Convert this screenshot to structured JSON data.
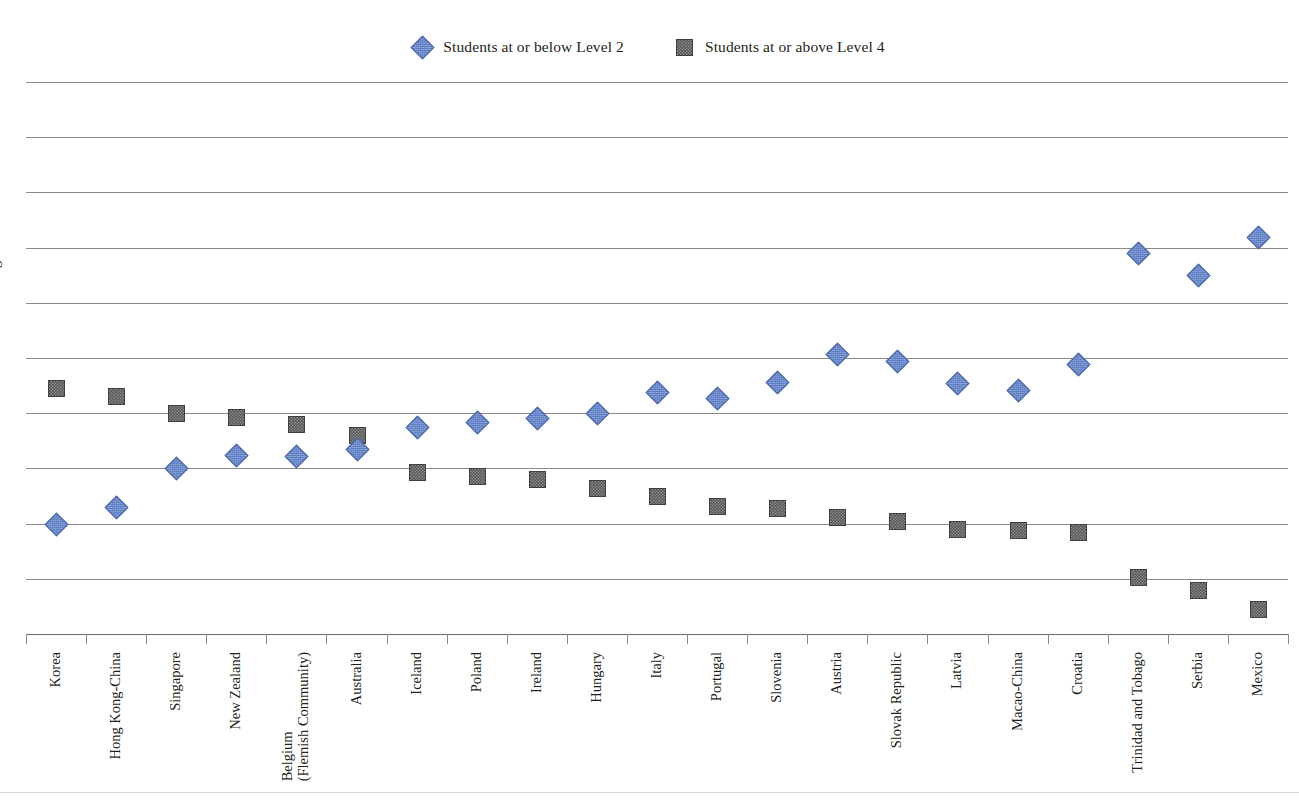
{
  "legend": {
    "items": [
      {
        "label": "Students at or below Level 2",
        "marker": "diamond-marker-icon",
        "color": "#5b7cc4"
      },
      {
        "label": "Students at or above Level 4",
        "marker": "square-marker-icon",
        "color": "#595959"
      }
    ]
  },
  "axes": {
    "ylabel": "Percentage of students",
    "yticks": [
      "0",
      "10",
      "20",
      "30",
      "40",
      "50",
      "60",
      "70",
      "80",
      "90",
      "100"
    ]
  },
  "chart_data": {
    "type": "scatter",
    "title": "",
    "xlabel": "",
    "ylabel": "Percentage of students",
    "ylim": [
      0,
      100
    ],
    "grid": true,
    "legend_position": "top-center",
    "categories": [
      "Korea",
      "Hong Kong-China",
      "Singapore",
      "New Zealand",
      "Belgium (Flemish Community)",
      "Australia",
      "Iceland",
      "Poland",
      "Ireland",
      "Hungary",
      "Italy",
      "Portugal",
      "Slovenia",
      "Austria",
      "Slovak Republic",
      "Latvia",
      "Macao-China",
      "Croatia",
      "Trinidad and Tobago",
      "Serbia",
      "Mexico"
    ],
    "series": [
      {
        "name": "Students at or below Level 2",
        "marker": "diamond",
        "color": "#5b7cc4",
        "values": [
          20.0,
          23.0,
          30.0,
          32.5,
          32.2,
          33.5,
          37.5,
          38.4,
          39.2,
          40.0,
          43.8,
          42.7,
          45.7,
          50.8,
          49.4,
          45.4,
          44.2,
          49.0,
          69.1,
          65.0,
          72.0
        ]
      },
      {
        "name": "Students at or above Level 4",
        "marker": "square",
        "color": "#595959",
        "values": [
          44.5,
          43.1,
          40.1,
          39.4,
          38.0,
          36.0,
          29.4,
          28.7,
          28.0,
          26.5,
          25.0,
          23.2,
          22.8,
          21.2,
          20.4,
          19.1,
          18.8,
          18.5,
          10.4,
          8.0,
          4.5
        ]
      }
    ]
  }
}
